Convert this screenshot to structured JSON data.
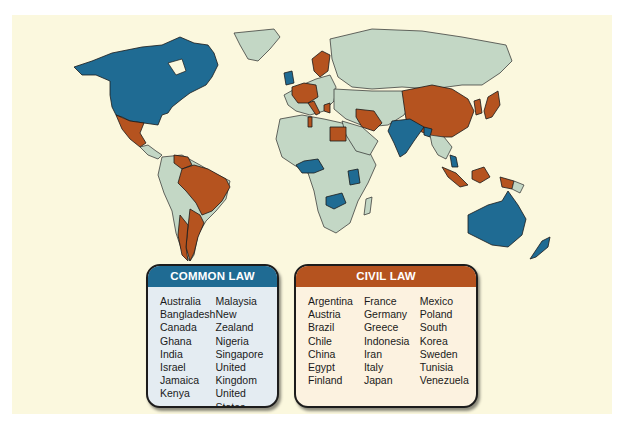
{
  "figure": {
    "top_cutoff_text": "",
    "colors": {
      "common_law": "#1f6b93",
      "civil_law": "#b5531f",
      "other": "#c3d7c5",
      "background": "#fbf8de"
    }
  },
  "legend_common": {
    "title": "COMMON LAW",
    "columns": [
      [
        "Australia",
        "Bangladesh",
        "Canada",
        "Ghana",
        "India",
        "Israel",
        "Jamaica",
        "Kenya"
      ],
      [
        "Malaysia",
        "New Zealand",
        "Nigeria",
        "Singapore",
        "United Kingdom",
        "United States",
        "Zambia"
      ]
    ]
  },
  "legend_civil": {
    "title": "CIVIL LAW",
    "columns": [
      [
        "Argentina",
        "Austria",
        "Brazil",
        "Chile",
        "China",
        "Egypt",
        "Finland"
      ],
      [
        "France",
        "Germany",
        "Greece",
        "Indonesia",
        "Iran",
        "Italy",
        "Japan"
      ],
      [
        "Mexico",
        "Poland",
        "South Korea",
        "Sweden",
        "Tunisia",
        "Venezuela"
      ]
    ]
  }
}
